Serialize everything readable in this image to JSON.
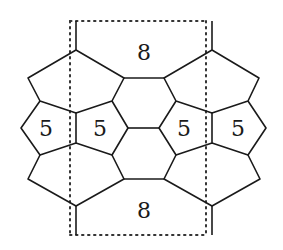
{
  "diagram": {
    "labels": {
      "top_face": "8",
      "bottom_face": "8",
      "pentagon_1": "5",
      "pentagon_2": "5",
      "pentagon_3": "5",
      "pentagon_4": "5"
    },
    "colors": {
      "stroke": "#1a1a1a",
      "dotted_boundary": "#333333",
      "background": "#ffffff"
    }
  }
}
